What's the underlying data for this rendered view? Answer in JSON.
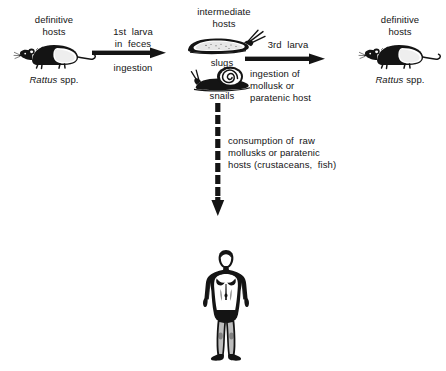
{
  "diagram": {
    "background": "#ffffff",
    "ink": "#141414"
  },
  "nodes": {
    "definitive_host_left": {
      "label_line1": "definitive",
      "label_line2": "hosts",
      "species_italic": "Rattus",
      "species_roman": " spp.",
      "organism": "rat"
    },
    "intermediate_hosts": {
      "label_line1": "intermediate",
      "label_line2": "hosts",
      "slug_label": "slugs",
      "snail_label": "snails",
      "organism_top": "slug",
      "organism_bottom": "snail"
    },
    "definitive_host_right": {
      "label_line1": "definitive",
      "label_line2": "hosts",
      "species_italic": "Rattus",
      "species_roman": " spp.",
      "organism": "rat"
    },
    "human_host": {
      "organism": "human"
    }
  },
  "arrows": {
    "left_to_center": {
      "above_line1": "1st  larva",
      "above_line2": "in  feces",
      "below_line1": "ingestion",
      "style": "solid",
      "direction": "right"
    },
    "center_to_right": {
      "above_line1": "3rd  larva",
      "below_line1": "ingestion of",
      "below_line2": "mollusk or",
      "below_line3": "paratenic host",
      "style": "solid",
      "direction": "right"
    },
    "center_to_human": {
      "text_line1": "consumption of  raw",
      "text_line2": "mollusks or paratenic",
      "text_line3": "hosts (crustaceans,  fish)",
      "style": "dashed",
      "direction": "down"
    }
  }
}
